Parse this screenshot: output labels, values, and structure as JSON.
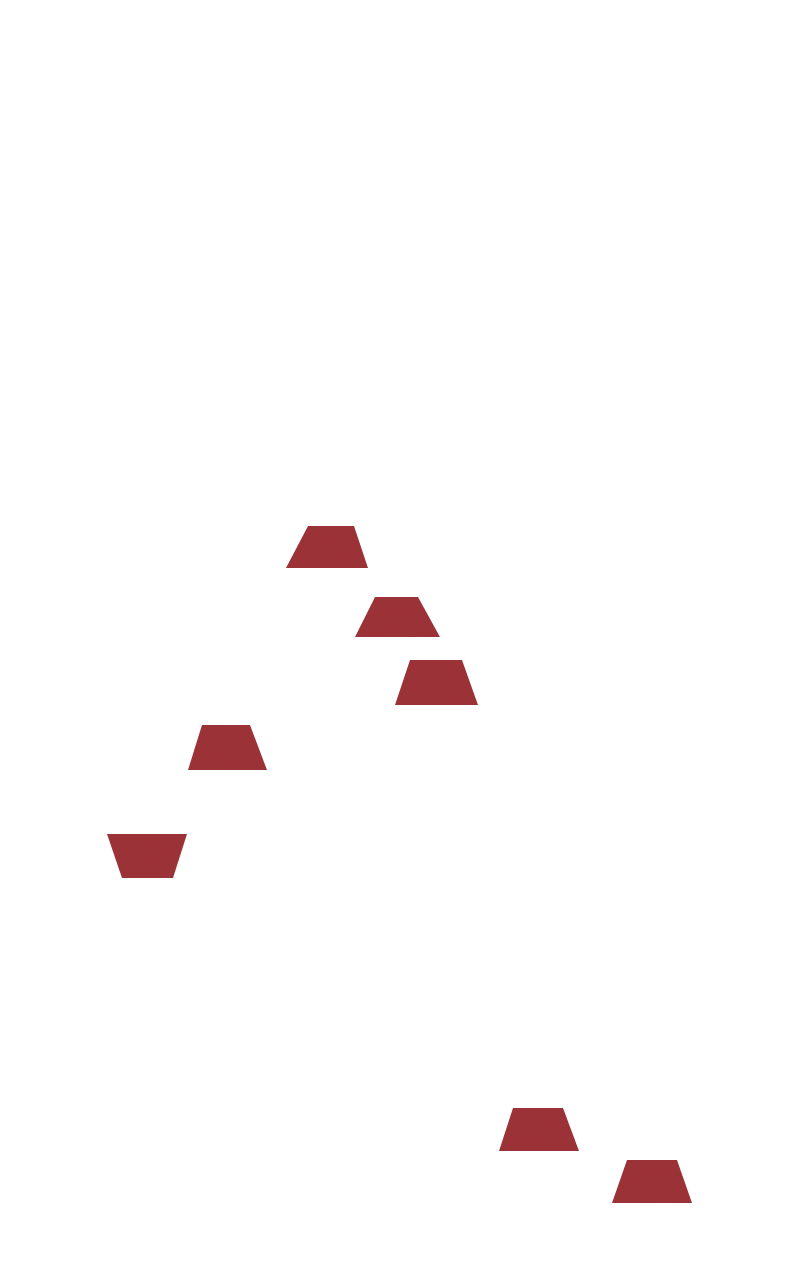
{
  "document": {
    "kind": "scanned-figure",
    "title": "Red Trapezoids",
    "width": 809,
    "height": 1277,
    "background_color": "#FFFFFF",
    "paper_tint_color": "#E4EDF6",
    "visible_text": ""
  },
  "palette": {
    "shape_fill": "#9E3338",
    "shape_fill_light": "#A83C40",
    "shape_fill_dark": "#8E2B30",
    "background": "#FFFFFF"
  },
  "chart_data": {
    "type": "scatter",
    "title": "",
    "xlabel": "",
    "ylabel": "",
    "grid": false,
    "legend": null,
    "marker": "trapezoid",
    "marker_color": "#9E3338",
    "count": 7,
    "xlim": [
      0,
      809
    ],
    "ylim": [
      0,
      1277
    ],
    "points": [
      {
        "id": 1,
        "cx": 329,
        "cy": 547,
        "width": 82,
        "height": 42,
        "orientation": "upright"
      },
      {
        "id": 2,
        "cx": 397,
        "cy": 617,
        "width": 85,
        "height": 40,
        "orientation": "upright"
      },
      {
        "id": 3,
        "cx": 436,
        "cy": 683,
        "width": 83,
        "height": 45,
        "orientation": "upright"
      },
      {
        "id": 4,
        "cx": 227,
        "cy": 748,
        "width": 79,
        "height": 45,
        "orientation": "upright"
      },
      {
        "id": 5,
        "cx": 147,
        "cy": 856,
        "width": 80,
        "height": 44,
        "orientation": "inverted"
      },
      {
        "id": 6,
        "cx": 539,
        "cy": 1130,
        "width": 80,
        "height": 43,
        "orientation": "upright"
      },
      {
        "id": 7,
        "cx": 652,
        "cy": 1182,
        "width": 80,
        "height": 43,
        "orientation": "upright"
      }
    ]
  },
  "shapes": [
    {
      "name": "trapezoid-1",
      "orientation": "upright",
      "points": "308,526 354,526 368,568 286,568",
      "fill": "#9E3338"
    },
    {
      "name": "trapezoid-2",
      "orientation": "upright",
      "points": "375,597 418,597 440,637 355,637",
      "fill": "#9E3338"
    },
    {
      "name": "trapezoid-3",
      "orientation": "upright",
      "points": "410,660 462,660 478,705 395,705",
      "fill": "#9E3338"
    },
    {
      "name": "trapezoid-4",
      "orientation": "upright",
      "points": "202,725 250,725 267,770 188,770",
      "fill": "#9E3338"
    },
    {
      "name": "trapezoid-5",
      "orientation": "inverted",
      "points": "107,834 187,834 173,878 122,878",
      "fill": "#9E3338"
    },
    {
      "name": "trapezoid-6",
      "orientation": "upright",
      "points": "513,1108 563,1108 579,1151 499,1151",
      "fill": "#9E3338"
    },
    {
      "name": "trapezoid-7",
      "orientation": "upright",
      "points": "627,1160 677,1160 692,1203 612,1203",
      "fill": "#9E3338"
    }
  ]
}
